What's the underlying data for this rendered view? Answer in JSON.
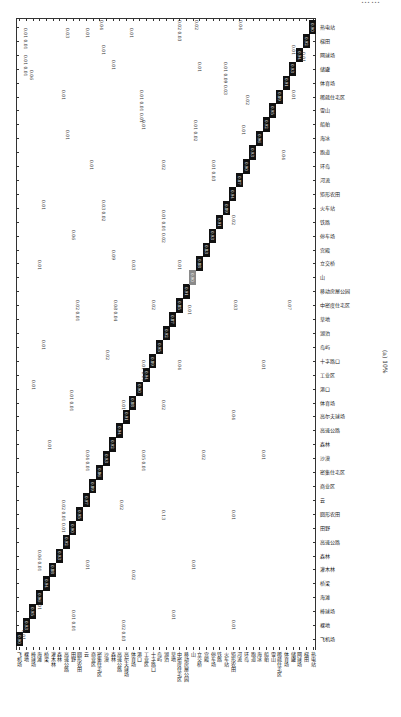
{
  "page": {
    "header_text": "……",
    "orientation": "rotated-90"
  },
  "figure": {
    "caption": "(a) 10%",
    "type": "confusion-matrix"
  },
  "chart_data": {
    "type": "heatmap",
    "title": "(a) 10%",
    "xlabel": "",
    "ylabel": "",
    "n_classes": 45,
    "class_labels": [
      "飞机场",
      "裸地",
      "棒球场",
      "海滩",
      "桥梁",
      "灌木林",
      "森林",
      "高速公路",
      "田野",
      "圆形农田",
      "云",
      "商业区",
      "密集住宅区",
      "沙漠",
      "森林",
      "高速公路",
      "高尔夫球场",
      "体育场",
      "港口",
      "工业区",
      "十字路口",
      "岛屿",
      "湖泊",
      "草地",
      "中密度住宅区",
      "移动房屋公园",
      "山",
      "立交桥",
      "宫殿",
      "停车场",
      "铁路",
      "火车站",
      "矩形农田",
      "河流",
      "环岛",
      "跑道",
      "海冰",
      "船舶",
      "雪山",
      "稀疏住宅区",
      "体育场",
      "储罐",
      "网球场",
      "梯田",
      "热电站",
      "湿地"
    ],
    "diagonal_values": [
      "0.90",
      "0.93",
      "0.95",
      "0.96",
      "0.94",
      "0.88",
      "0.93",
      "0.92",
      "0.90",
      "0.95",
      "0.97",
      "0.89",
      "0.86",
      "0.93",
      "0.92",
      "0.94",
      "0.91",
      "0.88",
      "0.90",
      "0.94",
      "0.89",
      "0.95",
      "0.92",
      "0.87",
      "0.85",
      "0.91",
      "0.90",
      "0.88",
      "0.83",
      "0.93",
      "0.91",
      "0.89",
      "0.94",
      "0.87",
      "0.90",
      "0.93",
      "0.96",
      "0.92",
      "0.95",
      "0.89",
      "0.91",
      "0.93",
      "0.94",
      "0.92",
      "0.90"
    ],
    "off_diagonal_samples": [
      "0.01",
      "0.02",
      "0.03",
      "0.04",
      "0.05",
      "0.06",
      "0.07",
      "0.08",
      "0.09",
      "0.13"
    ],
    "highlight_cell_index": 26,
    "colorscale": {
      "high": "#111111",
      "mid": "#8a8a8a",
      "low": "#ffffff"
    }
  },
  "off_values": [
    {
      "x": 22,
      "y": 28,
      "v": "0.01 0.01"
    },
    {
      "x": 64,
      "y": 28,
      "v": "0.03"
    },
    {
      "x": 84,
      "y": 28,
      "v": "0.01"
    },
    {
      "x": 98,
      "y": 20,
      "v": "0.04"
    },
    {
      "x": 128,
      "y": 28,
      "v": "0.01"
    },
    {
      "x": 176,
      "y": 20,
      "v": "0.02 0.03"
    },
    {
      "x": 193,
      "y": 20,
      "v": "0.02"
    },
    {
      "x": 237,
      "y": 20,
      "v": "0.04"
    },
    {
      "x": 100,
      "y": 45,
      "v": "0.01"
    },
    {
      "x": 290,
      "y": 45,
      "v": "0.01"
    },
    {
      "x": 22,
      "y": 55,
      "v": "0.01 0.01"
    },
    {
      "x": 110,
      "y": 60,
      "v": "0.01"
    },
    {
      "x": 196,
      "y": 62,
      "v": "0.01"
    },
    {
      "x": 222,
      "y": 62,
      "v": "0.01 0.09 0.03"
    },
    {
      "x": 300,
      "y": 52,
      "v": "0.01"
    },
    {
      "x": 28,
      "y": 70,
      "v": "0.06"
    },
    {
      "x": 60,
      "y": 90,
      "v": "0.01"
    },
    {
      "x": 138,
      "y": 90,
      "v": "0.01 0.01 0.01"
    },
    {
      "x": 244,
      "y": 95,
      "v": "0.02"
    },
    {
      "x": 290,
      "y": 90,
      "v": "0.01"
    },
    {
      "x": 64,
      "y": 130,
      "v": "0.01"
    },
    {
      "x": 140,
      "y": 120,
      "v": "0.01"
    },
    {
      "x": 192,
      "y": 120,
      "v": "0.01 0.02"
    },
    {
      "x": 240,
      "y": 125,
      "v": "0.01"
    },
    {
      "x": 88,
      "y": 160,
      "v": "0.01"
    },
    {
      "x": 160,
      "y": 160,
      "v": "0.02"
    },
    {
      "x": 210,
      "y": 160,
      "v": "0.01 0.03"
    },
    {
      "x": 280,
      "y": 150,
      "v": "0.04"
    },
    {
      "x": 40,
      "y": 200,
      "v": "0.01"
    },
    {
      "x": 100,
      "y": 200,
      "v": "0.03 0.02"
    },
    {
      "x": 160,
      "y": 210,
      "v": "0.01 0.01 0.02"
    },
    {
      "x": 230,
      "y": 215,
      "v": "0.02"
    },
    {
      "x": 70,
      "y": 230,
      "v": "0.06"
    },
    {
      "x": 110,
      "y": 250,
      "v": "0.09"
    },
    {
      "x": 130,
      "y": 260,
      "v": "0.03"
    },
    {
      "x": 176,
      "y": 260,
      "v": "0.01"
    },
    {
      "x": 36,
      "y": 260,
      "v": "0.01"
    },
    {
      "x": 74,
      "y": 300,
      "v": "0.02 0.01"
    },
    {
      "x": 112,
      "y": 300,
      "v": "0.08 0.04"
    },
    {
      "x": 150,
      "y": 300,
      "v": "0.02"
    },
    {
      "x": 186,
      "y": 305,
      "v": "0.01"
    },
    {
      "x": 232,
      "y": 300,
      "v": "0.03"
    },
    {
      "x": 286,
      "y": 300,
      "v": "0.07"
    },
    {
      "x": 40,
      "y": 340,
      "v": "0.01"
    },
    {
      "x": 104,
      "y": 350,
      "v": "0.02"
    },
    {
      "x": 140,
      "y": 360,
      "v": "0.01 0.01"
    },
    {
      "x": 176,
      "y": 360,
      "v": "0.04"
    },
    {
      "x": 260,
      "y": 360,
      "v": "0.01"
    },
    {
      "x": 30,
      "y": 380,
      "v": "0.01"
    },
    {
      "x": 68,
      "y": 390,
      "v": "0.01 0.01"
    },
    {
      "x": 120,
      "y": 400,
      "v": "0.01"
    },
    {
      "x": 160,
      "y": 400,
      "v": "0.02"
    },
    {
      "x": 230,
      "y": 410,
      "v": "0.04"
    },
    {
      "x": 46,
      "y": 440,
      "v": "0.01"
    },
    {
      "x": 84,
      "y": 450,
      "v": "0.04 0.01"
    },
    {
      "x": 140,
      "y": 450,
      "v": "0.05 0.01"
    },
    {
      "x": 200,
      "y": 450,
      "v": "0.02"
    },
    {
      "x": 260,
      "y": 450,
      "v": "0.01"
    },
    {
      "x": 60,
      "y": 500,
      "v": "0.02 0.01 0.01"
    },
    {
      "x": 118,
      "y": 500,
      "v": "0.02"
    },
    {
      "x": 160,
      "y": 510,
      "v": "0.13"
    },
    {
      "x": 230,
      "y": 510,
      "v": "0.01"
    },
    {
      "x": 36,
      "y": 550,
      "v": "0.06 0.01"
    },
    {
      "x": 84,
      "y": 560,
      "v": "0.01"
    },
    {
      "x": 130,
      "y": 570,
      "v": "0.02"
    },
    {
      "x": 190,
      "y": 560,
      "v": "0.01"
    },
    {
      "x": 36,
      "y": 600,
      "v": "0.01"
    },
    {
      "x": 70,
      "y": 610,
      "v": "0.01 0.01"
    },
    {
      "x": 120,
      "y": 620,
      "v": "0.02 0.03"
    },
    {
      "x": 170,
      "y": 610,
      "v": "0.01"
    },
    {
      "x": 230,
      "y": 620,
      "v": "0.01"
    },
    {
      "x": 20,
      "y": 630,
      "v": "0.01"
    }
  ]
}
